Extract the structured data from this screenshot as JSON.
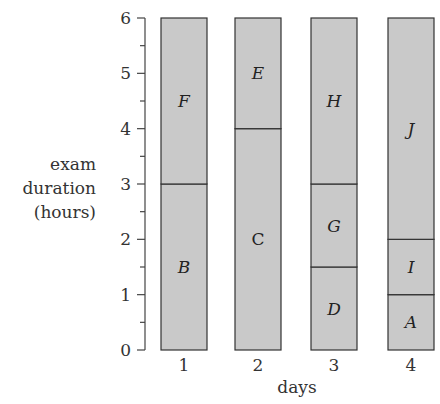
{
  "chart_data": {
    "type": "bar",
    "stacked": true,
    "title": "",
    "xlabel": "days",
    "ylabel": [
      "exam",
      "duration",
      "(hours)"
    ],
    "ylim": [
      0,
      6
    ],
    "yticks": [
      0,
      1,
      2,
      3,
      4,
      5,
      6
    ],
    "yminor_step": 0.5,
    "categories": [
      "1",
      "2",
      "3",
      "4"
    ],
    "grid": false,
    "legend": null,
    "bar_fill": "#c9c9c9",
    "bar_stroke": "#333333",
    "bars": [
      {
        "day": "1",
        "segments": [
          {
            "label": "B",
            "start": 0,
            "end": 3
          },
          {
            "label": "F",
            "start": 3,
            "end": 6
          }
        ]
      },
      {
        "day": "2",
        "segments": [
          {
            "label": "C",
            "start": 0,
            "end": 4
          },
          {
            "label": "E",
            "start": 4,
            "end": 6
          }
        ]
      },
      {
        "day": "3",
        "segments": [
          {
            "label": "D",
            "start": 0,
            "end": 1.5
          },
          {
            "label": "G",
            "start": 1.5,
            "end": 3
          },
          {
            "label": "H",
            "start": 3,
            "end": 6
          }
        ]
      },
      {
        "day": "4",
        "segments": [
          {
            "label": "A",
            "start": 0,
            "end": 1
          },
          {
            "label": "I",
            "start": 1,
            "end": 2
          },
          {
            "label": "J",
            "start": 2,
            "end": 6
          }
        ]
      }
    ]
  }
}
